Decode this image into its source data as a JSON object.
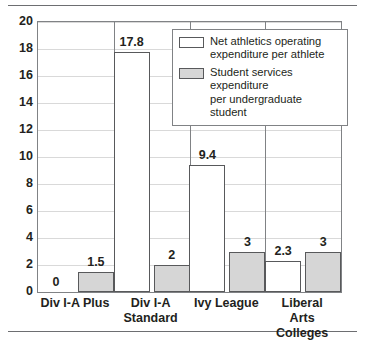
{
  "chart_data": {
    "type": "bar",
    "title": "",
    "subtitle": "",
    "xlabel": "",
    "ylabel": "",
    "ylim": [
      0,
      20
    ],
    "ytick_step": 2,
    "ytick_labels": [
      "0",
      "2",
      "4",
      "6",
      "8",
      "10",
      "12",
      "14",
      "16",
      "18",
      "20"
    ],
    "grid": true,
    "legend_position": "top-right",
    "categories": [
      "Div I-A Plus",
      "Div I-A\nStandard",
      "Ivy League",
      "Liberal Arts\nColleges"
    ],
    "series": [
      {
        "name": "Net athletics operating expenditure per athlete",
        "color": "#ffffff",
        "values": [
          0,
          17.8,
          9.4,
          2.3
        ],
        "labels": [
          "0",
          "17.8",
          "9.4",
          "2.3"
        ]
      },
      {
        "name": "Student services expenditure per undergraduate student",
        "color": "#d6d6d6",
        "values": [
          1.5,
          2,
          3,
          3
        ],
        "labels": [
          "1.5",
          "2",
          "3",
          "3"
        ]
      }
    ]
  },
  "legend": {
    "items": [
      {
        "swatch": "white",
        "label": "Net athletics operating\nexpenditure per athlete"
      },
      {
        "swatch": "gray",
        "label": "Student services expenditure\nper undergraduate student"
      }
    ]
  },
  "colors": {
    "series_white_fill": "#ffffff",
    "series_gray_fill": "#d6d6d6",
    "bar_outline": "#58595b",
    "gridline": "#d9d9d9",
    "axis": "#808285",
    "text": "#231f20"
  }
}
